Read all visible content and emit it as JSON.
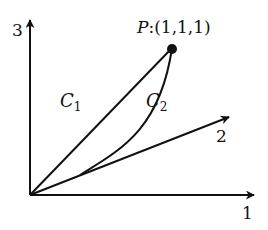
{
  "diagram": {
    "type": "3d-coordinate-axes-with-curves",
    "axes": [
      {
        "id": "axis-1",
        "label": "1",
        "direction": "horizontal-right"
      },
      {
        "id": "axis-2",
        "label": "2",
        "direction": "diagonal-up-right"
      },
      {
        "id": "axis-3",
        "label": "3",
        "direction": "vertical-up"
      }
    ],
    "point": {
      "name": "P",
      "separator": ":",
      "coordinates": "(1,1,1)"
    },
    "curves": [
      {
        "name": "C",
        "subscript": "1",
        "shape": "straight line from origin to P"
      },
      {
        "name": "C",
        "subscript": "2",
        "shape": "along axis 2 then curving up to P"
      }
    ],
    "colors": {
      "stroke": "#111111",
      "background": "#ffffff"
    }
  }
}
